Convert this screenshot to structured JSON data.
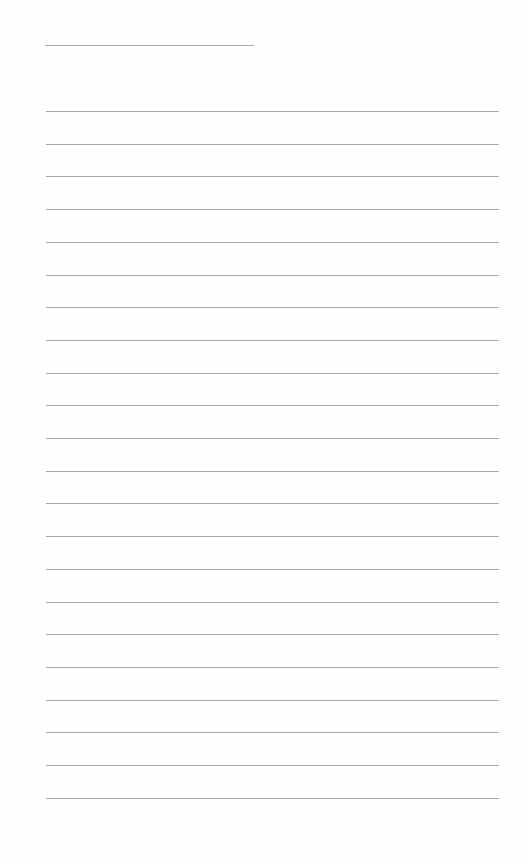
{
  "document": {
    "type": "lined-paper",
    "header_line": {
      "left": 45,
      "top": 45,
      "width": 209
    },
    "ruled_lines": {
      "count": 22,
      "first_top": 111,
      "spacing": 32.7,
      "left": 46,
      "width": 453
    },
    "line_color": "#a9a9a9",
    "background_color": "#fefefe"
  }
}
